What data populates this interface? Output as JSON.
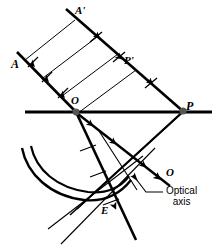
{
  "figure": {
    "width": 218,
    "height": 245,
    "background": "#ffffff",
    "ink": "#000000"
  },
  "labels": {
    "point_A": "A",
    "point_A_prime": "A'",
    "point_P_prime": "P'",
    "point_O": "O",
    "point_P": "P",
    "point_O_lower": "O",
    "point_E": "E",
    "optical_axis": "Optical\naxis",
    "optical_axis_line1": "Optical",
    "optical_axis_line2": "axis"
  },
  "geometry": {
    "optical_axis": {
      "x1": 25,
      "y1": 112,
      "x2": 212,
      "y2": 112,
      "stroke_width": 2.6
    },
    "vertex_O": {
      "x": 76,
      "y": 112,
      "r": 3.2
    },
    "focus_P": {
      "x": 183,
      "y": 111,
      "r": 3.4
    },
    "incident_rays": [
      {
        "name": "ray-A",
        "x1": 17,
        "y1": 52,
        "x2": 76,
        "y2": 112
      },
      {
        "name": "ray-A-prime",
        "x1": 66,
        "y1": 9,
        "x2": 128,
        "y2": 70
      },
      {
        "name": "ray-P-prime",
        "x1": 128,
        "y1": 70,
        "x2": 183,
        "y2": 111
      }
    ],
    "wavefronts": [
      {
        "name": "wavefront-1",
        "x1": 25,
        "y1": 60,
        "x2": 75,
        "y2": 20
      },
      {
        "name": "wavefront-2",
        "x1": 43,
        "y1": 78,
        "x2": 97,
        "y2": 37
      },
      {
        "name": "wavefront-3",
        "x1": 62,
        "y1": 96,
        "x2": 118,
        "y2": 54
      },
      {
        "name": "wavefront-4",
        "x1": 78,
        "y1": 112,
        "x2": 136,
        "y2": 70
      }
    ],
    "reflected_ray": {
      "x1": 76,
      "y1": 112,
      "x2": 133,
      "y2": 235
    },
    "mirror_arcs": [
      {
        "name": "mirror-arc-outer",
        "d": "M 22,148 C 28,175 52,196 84,200 C 103,202 118,195 128,183"
      },
      {
        "name": "mirror-arc-inner",
        "d": "M 30,146 C 36,172 58,190 88,194 C 106,196 119,190 127,180"
      }
    ],
    "converging_rays": [
      {
        "name": "converge-ray-1",
        "x1": 183,
        "y1": 111,
        "x2": 72,
        "y2": 212
      },
      {
        "name": "converge-ray-2",
        "x1": 183,
        "y1": 111,
        "x2": 78,
        "y2": 208
      },
      {
        "name": "converge-ray-3",
        "x1": 183,
        "y1": 111,
        "x2": 85,
        "y2": 203
      }
    ],
    "tangent_lines": [
      {
        "name": "tangent-1",
        "x1": 62,
        "y1": 244,
        "x2": 152,
        "y2": 152
      },
      {
        "name": "tangent-2",
        "x1": 50,
        "y1": 232,
        "x2": 140,
        "y2": 160
      }
    ],
    "axis_leader": {
      "tip_x": 137,
      "tip_y": 173,
      "elbow_x": 148,
      "elbow_y": 200,
      "tail_x": 164,
      "tail_y": 193
    }
  },
  "markers": {
    "arrowhead_count": 8,
    "tick_count": 7,
    "arrowhead_style": "solid-filled-triangle",
    "tick_style": "short-perpendicular-stroke"
  }
}
